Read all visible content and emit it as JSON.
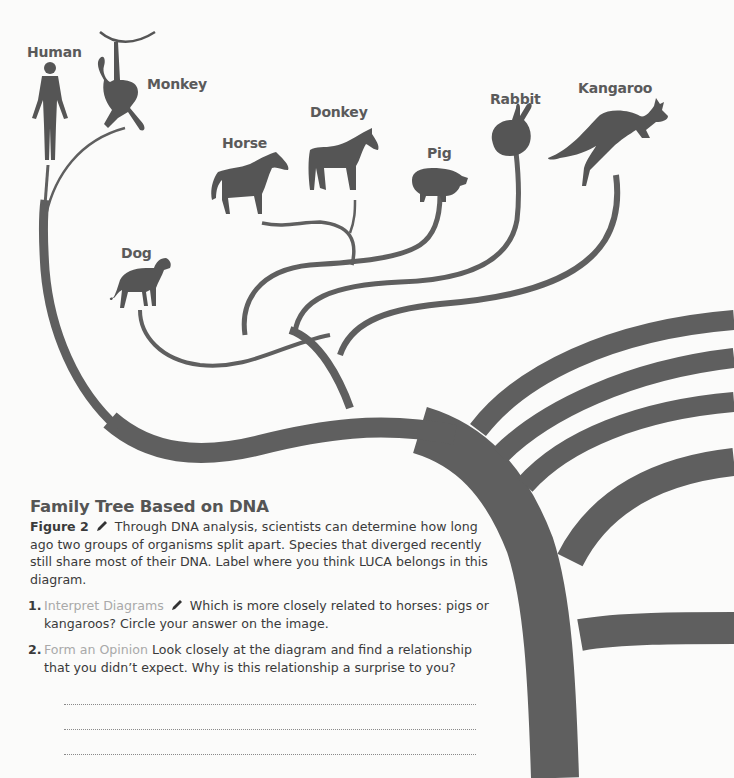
{
  "diagram": {
    "title": "Family Tree Based on DNA",
    "branch_color": "#5f5f5f",
    "taxa": [
      {
        "name": "Human"
      },
      {
        "name": "Monkey"
      },
      {
        "name": "Horse"
      },
      {
        "name": "Donkey"
      },
      {
        "name": "Pig"
      },
      {
        "name": "Rabbit"
      },
      {
        "name": "Kangaroo"
      },
      {
        "name": "Dog"
      }
    ]
  },
  "caption": {
    "title": "Family Tree Based on DNA",
    "figure_label": "Figure 2",
    "pencil_icon": "pencil-icon",
    "text": "Through DNA analysis, scientists can determine how long ago two groups of organisms split apart. Species that diverged recently still share most of their DNA. Label where you think LUCA belongs in this diagram."
  },
  "questions": [
    {
      "number": "1.",
      "skill": "Interpret Diagrams",
      "has_pencil": true,
      "text": "Which is more closely related to horses: pigs or kangaroos? Circle your answer on the image."
    },
    {
      "number": "2.",
      "skill": "Form an Opinion",
      "has_pencil": false,
      "text": "Look closely at the diagram and find a relationship that you didn’t expect. Why is this relationship a surprise to you?"
    }
  ],
  "answer_lines": 3
}
